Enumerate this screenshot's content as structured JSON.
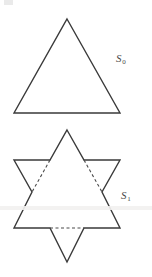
{
  "figure": {
    "background_color": "#ffffff",
    "stroke_color": "#3a3a3a",
    "label_color": "#4a4a4a",
    "stroke_width": 1.4,
    "dash_pattern": "3,2.5",
    "width": 152,
    "height": 277,
    "stages": [
      {
        "id": "s0",
        "label_base": "S",
        "label_sub": "0",
        "shape": "equilateral-triangle",
        "description": "Stage 0: plain equilateral triangle",
        "solid_path": "M 67 19 L 120 113 L 14 113 Z",
        "dashed_path": "",
        "vertices": [
          [
            67,
            19
          ],
          [
            120,
            113
          ],
          [
            14,
            113
          ]
        ],
        "label_x": 116,
        "label_y": 52
      },
      {
        "id": "s1",
        "label_base": "S",
        "label_sub": "1",
        "shape": "hexagram",
        "description": "Stage 1: Star of David with dashed original triangle edges",
        "solid_path": "M 67 130 L 84 160 L 120 160 L 102 192 L 120 228 L 84 228 L 67 262 L 50 228 L 14 228 L 32 192 L 14 160 L 50 160 Z",
        "dashed_path": "M 50 160 L 32 192 M 84 160 L 102 192 M 50 228 L 84 228",
        "outer_points": [
          [
            67,
            130
          ],
          [
            120,
            160
          ],
          [
            120,
            228
          ],
          [
            67,
            262
          ],
          [
            14,
            228
          ],
          [
            14,
            160
          ]
        ],
        "inner_points": [
          [
            84,
            160
          ],
          [
            102,
            192
          ],
          [
            84,
            228
          ],
          [
            50,
            228
          ],
          [
            32,
            192
          ],
          [
            50,
            160
          ]
        ],
        "label_x": 121,
        "label_y": 189
      }
    ]
  },
  "artifacts": {
    "corner_mark": "scan-artifact-top-left",
    "scan_band": "horizontal-scan-band"
  }
}
